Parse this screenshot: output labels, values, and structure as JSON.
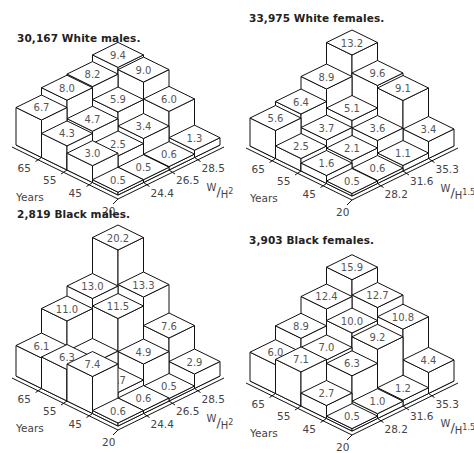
{
  "chart_data": [
    {
      "type": "bar3d",
      "title": "30,167 White males.",
      "xlabel": "Years",
      "ylabel": "W/H2",
      "ylabel_main": "W",
      "ylabel_denom": "H",
      "ylabel_exp": "2",
      "age_ticks": [
        "20",
        "45",
        "55",
        "65"
      ],
      "bmi_ticks": [
        "24.4",
        "26.5",
        "28.5"
      ],
      "age_bins": [
        "20-45",
        "45-55",
        "55-65",
        "65+"
      ],
      "bmi_bins": [
        "<24.4",
        "24.4-26.5",
        "26.5-28.5",
        ">28.5"
      ],
      "values": [
        [
          0.5,
          0.5,
          0.6,
          1.3
        ],
        [
          3.0,
          2.5,
          3.4,
          6.0
        ],
        [
          4.3,
          4.7,
          5.9,
          9.0
        ],
        [
          6.7,
          8.0,
          8.2,
          9.4
        ]
      ],
      "labels": [
        [
          "0.5",
          "0.5",
          "0.6",
          "1.3"
        ],
        [
          "3.0",
          "2.5",
          "3.4",
          "6.0"
        ],
        [
          "4.3",
          "4.7",
          "5.9",
          "9.0"
        ],
        [
          "6.7",
          "8.0",
          "8.2",
          "9.4"
        ]
      ]
    },
    {
      "type": "bar3d",
      "title": "33,975 White females.",
      "xlabel": "Years",
      "ylabel": "W/H1.5",
      "ylabel_main": "W",
      "ylabel_denom": "H",
      "ylabel_exp": "1.5",
      "age_ticks": [
        "20",
        "45",
        "55",
        "65"
      ],
      "bmi_ticks": [
        "28.2",
        "31.6",
        "35.3"
      ],
      "age_bins": [
        "20-45",
        "45-55",
        "55-65",
        "65+"
      ],
      "bmi_bins": [
        "<28.2",
        "28.2-31.6",
        "31.6-35.3",
        ">35.3"
      ],
      "values": [
        [
          0.5,
          0.6,
          1.1,
          3.4
        ],
        [
          1.6,
          2.1,
          3.6,
          9.1
        ],
        [
          2.5,
          3.7,
          5.1,
          9.6
        ],
        [
          5.6,
          6.4,
          8.9,
          13.2
        ]
      ],
      "labels": [
        [
          "0.5",
          "0.6",
          "1.1",
          "3.4"
        ],
        [
          "1.6",
          "2.1",
          "3.6",
          "9.1"
        ],
        [
          "2.5",
          "3.7",
          "5.1",
          "9.6"
        ],
        [
          "5.6",
          "6.4",
          "8.9",
          "13.2"
        ]
      ]
    },
    {
      "type": "bar3d",
      "title": "2,819 Black males.",
      "xlabel": "Years",
      "ylabel": "W/H2",
      "ylabel_main": "W",
      "ylabel_denom": "H",
      "ylabel_exp": "2",
      "age_ticks": [
        "20",
        "45",
        "55",
        "65"
      ],
      "bmi_ticks": [
        "24.4",
        "26.5",
        "28.5"
      ],
      "age_bins": [
        "20-45",
        "45-55",
        "55-65",
        "65+"
      ],
      "bmi_bins": [
        "<24.4",
        "24.4-26.5",
        "26.5-28.5",
        ">28.5"
      ],
      "values": [
        [
          0.6,
          0.6,
          0.5,
          2.9
        ],
        [
          7.4,
          1.7,
          4.9,
          7.6
        ],
        [
          6.3,
          5.0,
          11.5,
          13.3
        ],
        [
          6.1,
          11.0,
          13.0,
          20.2
        ]
      ],
      "labels": [
        [
          "0.6",
          "0.6",
          "0.5",
          "2.9"
        ],
        [
          "7.4",
          "1.7",
          "4.9",
          "7.6"
        ],
        [
          "6.3",
          "",
          "11.5",
          "13.3"
        ],
        [
          "6.1",
          "11.0",
          "13.0",
          "20.2"
        ]
      ]
    },
    {
      "type": "bar3d",
      "title": "3,903 Black females.",
      "xlabel": "Years",
      "ylabel": "W/H1.5",
      "ylabel_main": "W",
      "ylabel_denom": "H",
      "ylabel_exp": "1.5",
      "age_ticks": [
        "20",
        "45",
        "55",
        "65"
      ],
      "bmi_ticks": [
        "28.2",
        "31.6",
        "35.3"
      ],
      "age_bins": [
        "20-45",
        "45-55",
        "55-65",
        "65+"
      ],
      "bmi_bins": [
        "<28.2",
        "28.2-31.6",
        "31.6-35.3",
        ">35.3"
      ],
      "values": [
        [
          0.5,
          1.0,
          1.2,
          4.4
        ],
        [
          2.7,
          6.3,
          9.2,
          10.8
        ],
        [
          7.1,
          7.0,
          10.0,
          12.7
        ],
        [
          6.0,
          8.9,
          12.4,
          15.9
        ]
      ],
      "labels": [
        [
          "0.5",
          "1.0",
          "1.2",
          "4.4"
        ],
        [
          "2.7",
          "6.3",
          "9.2",
          "10.8"
        ],
        [
          "7.1",
          "7.0",
          "10.0",
          "12.7"
        ],
        [
          "6.0",
          "8.9",
          "12.4",
          "15.9"
        ]
      ]
    }
  ],
  "layout": {
    "panels": [
      {
        "left": 0,
        "top": 0,
        "title_x": 17,
        "title_y": 32,
        "origin_x": 118,
        "origin_y": 195,
        "scale": 5.6
      },
      {
        "left": 237,
        "top": 0,
        "title_x": 12,
        "title_y": 12,
        "origin_x": 115,
        "origin_y": 196,
        "scale": 5.0
      },
      {
        "left": 0,
        "top": 226,
        "title_x": 17,
        "title_y": -18,
        "origin_x": 118,
        "origin_y": 200,
        "scale": 5.0
      },
      {
        "left": 237,
        "top": 226,
        "title_x": 12,
        "title_y": 8,
        "origin_x": 115,
        "origin_y": 205,
        "scale": 4.8
      }
    ]
  }
}
